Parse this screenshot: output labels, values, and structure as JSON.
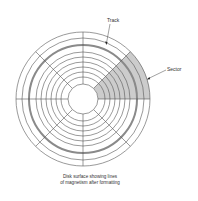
{
  "diagram": {
    "title": "Disk surface showing lines of magnetism after formatting",
    "center": [
      83,
      99
    ],
    "outer_radius": 67,
    "hub_radius": 15,
    "ring_radii": [
      61,
      54,
      47,
      42,
      37,
      32,
      27,
      22
    ],
    "highlighted_track_radius": 54,
    "radial_line_angles_deg": [
      0,
      45,
      90,
      135,
      180,
      225,
      270,
      315
    ],
    "shaded_sector": {
      "start_angle_deg": 0,
      "end_angle_deg": 45
    },
    "colors": {
      "line": "#555555",
      "track": "#8a8a8a",
      "sector_fill": "#cccccc",
      "text": "#333333"
    },
    "labels": {
      "track": "Track",
      "sector": "Sector"
    },
    "caption": {
      "line1": "Disk surface showing lines",
      "line2": "of magnetism after formatting"
    }
  }
}
